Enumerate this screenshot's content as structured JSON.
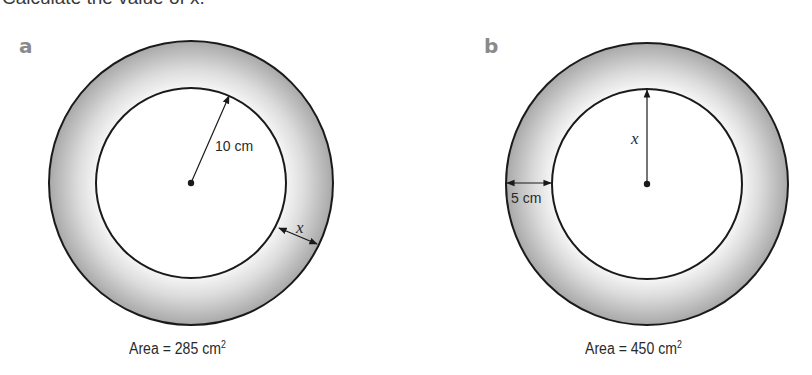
{
  "question": {
    "title": "Calculate the value of x."
  },
  "figures": [
    {
      "label": "a",
      "inner_radius_label": "10 cm",
      "ring_width_label": "x",
      "area_prefix": "Area = 285 cm",
      "area_exp": "2",
      "area_value": 285,
      "area_unit": "cm²"
    },
    {
      "label": "b",
      "inner_radius_label": "x",
      "ring_width_label": "5 cm",
      "area_prefix": "Area = 450 cm",
      "area_exp": "2",
      "area_value": 450,
      "area_unit": "cm²"
    }
  ],
  "colors": {
    "ring_outer": "#a9a9a9",
    "ring_inner": "#f4f4f4",
    "stroke": "#1a1a1a",
    "label_gray": "#8a8a8a"
  }
}
